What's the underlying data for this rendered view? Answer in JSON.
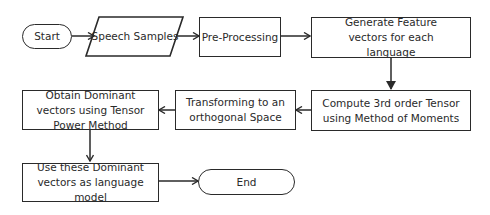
{
  "diagram": {
    "type": "flowchart",
    "nodes": [
      {
        "id": "start",
        "shape": "terminator",
        "label": "Start"
      },
      {
        "id": "speech",
        "shape": "parallelogram",
        "label": "Speech Samples"
      },
      {
        "id": "preproc",
        "shape": "rectangle",
        "label": "Pre-Processing"
      },
      {
        "id": "generate",
        "shape": "rectangle",
        "label": "Generate Feature vectors for each language"
      },
      {
        "id": "compute",
        "shape": "rectangle",
        "label": "Compute 3rd order Tensor using Method of Moments"
      },
      {
        "id": "transform",
        "shape": "rectangle",
        "label": "Transforming to an orthogonal Space"
      },
      {
        "id": "obtain",
        "shape": "rectangle",
        "label": "Obtain Dominant vectors using Tensor Power Method"
      },
      {
        "id": "use",
        "shape": "rectangle",
        "label": "Use these Dominant vectors as language model"
      },
      {
        "id": "end",
        "shape": "terminator",
        "label": "End"
      }
    ],
    "edges": [
      {
        "from": "start",
        "to": "speech"
      },
      {
        "from": "speech",
        "to": "preproc"
      },
      {
        "from": "preproc",
        "to": "generate"
      },
      {
        "from": "generate",
        "to": "compute"
      },
      {
        "from": "compute",
        "to": "transform"
      },
      {
        "from": "transform",
        "to": "obtain"
      },
      {
        "from": "obtain",
        "to": "use"
      },
      {
        "from": "use",
        "to": "end"
      }
    ],
    "colors": {
      "stroke": "#2a2a2a",
      "fill": "#ffffff",
      "background": "#ffffff"
    }
  }
}
